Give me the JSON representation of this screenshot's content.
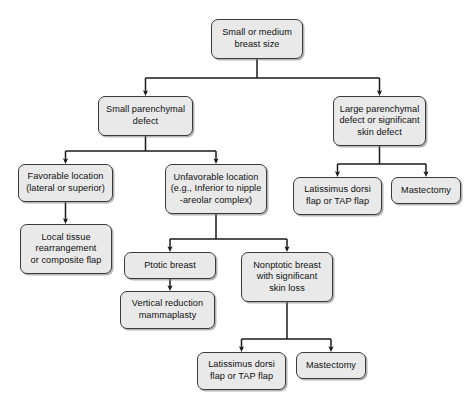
{
  "diagram": {
    "background_color": "#ffffff",
    "node_fill_color": "#e9e9e9",
    "node_border_color": "#3a3a3a",
    "edge_color": "#1a1a1a",
    "text_color": "#101010"
  },
  "nodes": [
    {
      "id": "root",
      "label": "Small or medium\nbreast size",
      "x": 211,
      "y": 19,
      "w": 92,
      "h": 40
    },
    {
      "id": "small-defect",
      "label": "Small parenchymal\ndefect",
      "x": 98,
      "y": 96,
      "w": 95,
      "h": 40
    },
    {
      "id": "large-defect",
      "label": "Large parenchymal\ndefect or significant\nskin defect",
      "x": 333,
      "y": 96,
      "w": 93,
      "h": 50
    },
    {
      "id": "favorable-location",
      "label": "Favorable location\n(lateral or superior)",
      "x": 18,
      "y": 164,
      "w": 95,
      "h": 38
    },
    {
      "id": "unfavorable-location",
      "label": "Unfavorable location\n(e.g., Inferior to nipple\n-areolar complex)",
      "x": 165,
      "y": 164,
      "w": 102,
      "h": 50
    },
    {
      "id": "lat-dorsi-right",
      "label": "Latissimus dorsi\nflap or TAP flap",
      "x": 293,
      "y": 177,
      "w": 89,
      "h": 38
    },
    {
      "id": "mastectomy-right",
      "label": "Mastectomy",
      "x": 391,
      "y": 177,
      "w": 70,
      "h": 27
    },
    {
      "id": "local-tissue",
      "label": "Local tissue\nrearrangement\nor composite flap",
      "x": 20,
      "y": 224,
      "w": 92,
      "h": 50
    },
    {
      "id": "ptotic-breast",
      "label": "Ptotic breast",
      "x": 124,
      "y": 252,
      "w": 92,
      "h": 27
    },
    {
      "id": "nonptotic-breast",
      "label": "Nonptotic breast\nwith significant\nskin loss",
      "x": 241,
      "y": 252,
      "w": 92,
      "h": 50
    },
    {
      "id": "vertical-reduction",
      "label": "Vertical reduction\nmammaplasty",
      "x": 120,
      "y": 291,
      "w": 95,
      "h": 38
    },
    {
      "id": "lat-dorsi-bottom",
      "label": "Latissimus dorsi\nflap or TAP flap",
      "x": 197,
      "y": 352,
      "w": 89,
      "h": 38
    },
    {
      "id": "mastectomy-bottom",
      "label": "Mastectomy",
      "x": 296,
      "y": 352,
      "w": 70,
      "h": 27
    }
  ],
  "edges": [
    {
      "id": "root-to-branch",
      "from": "root",
      "to": [
        "small-defect",
        "large-defect"
      ],
      "type": "split"
    },
    {
      "id": "small-defect-to-branch",
      "from": "small-defect",
      "to": [
        "favorable-location",
        "unfavorable-location"
      ],
      "type": "split"
    },
    {
      "id": "large-defect-to-branch",
      "from": "large-defect",
      "to": [
        "lat-dorsi-right",
        "mastectomy-right"
      ],
      "type": "split"
    },
    {
      "id": "favorable-to-local-tissue",
      "from": "favorable-location",
      "to": [
        "local-tissue"
      ],
      "type": "straight"
    },
    {
      "id": "unfavorable-to-branch",
      "from": "unfavorable-location",
      "to": [
        "ptotic-breast",
        "nonptotic-breast"
      ],
      "type": "split"
    },
    {
      "id": "ptotic-to-vertical",
      "from": "ptotic-breast",
      "to": [
        "vertical-reduction"
      ],
      "type": "straight"
    },
    {
      "id": "nonptotic-to-branch",
      "from": "nonptotic-breast",
      "to": [
        "lat-dorsi-bottom",
        "mastectomy-bottom"
      ],
      "type": "split"
    }
  ]
}
